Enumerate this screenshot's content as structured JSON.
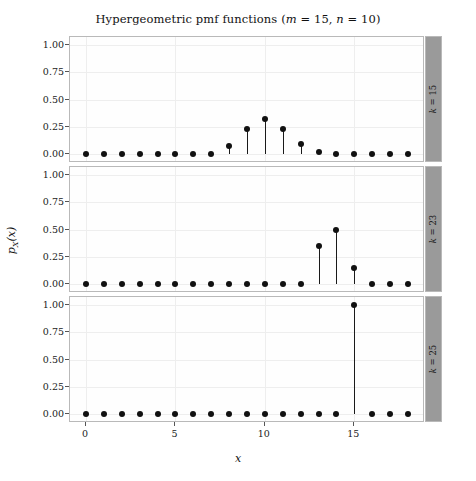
{
  "chart_data": {
    "type": "scatter",
    "title": "Hypergeometric pmf functions (m = 15, n = 10)",
    "title_parts": {
      "lead": "Hypergeometric pmf functions (",
      "m_sym": "m",
      "m_eq": " = 15, ",
      "n_sym": "n",
      "n_eq": " = 10)"
    },
    "xlabel": "x",
    "ylabel": "pX (x)",
    "ylabel_parts": {
      "p": "p",
      "sub": "X",
      "arg": "(x)"
    },
    "grid": true,
    "legend": "none",
    "xlim": [
      -0.9,
      18.9
    ],
    "ylim": [
      -0.06,
      1.06
    ],
    "xticks": [
      0,
      5,
      10,
      15
    ],
    "xticklabels": [
      "0",
      "5",
      "10",
      "15"
    ],
    "yticks": [
      0,
      0.25,
      0.5,
      0.75,
      1.0
    ],
    "yticklabels": [
      "0.00",
      "0.25",
      "0.50",
      "0.75",
      "1.00"
    ],
    "x": [
      0,
      1,
      2,
      3,
      4,
      5,
      6,
      7,
      8,
      9,
      10,
      11,
      12,
      13,
      14,
      15,
      16,
      17,
      18
    ],
    "panels": [
      {
        "strip_label": "k = 15",
        "strip_parts": {
          "k": "k",
          "eq": " = 15"
        },
        "k": 15,
        "values": [
          0,
          0,
          0,
          0,
          0,
          0,
          0,
          0.0009,
          0.0725,
          0.235,
          0.3204,
          0.235,
          0.0907,
          0.0181,
          0.0015,
          0,
          0,
          0,
          0
        ]
      },
      {
        "strip_label": "k = 23",
        "strip_parts": {
          "k": "k",
          "eq": " = 23"
        },
        "k": 23,
        "values": [
          0,
          0,
          0,
          0,
          0,
          0,
          0,
          0,
          0,
          0,
          0,
          0,
          0,
          0.3478,
          0.5,
          0.1522,
          0,
          0,
          0
        ]
      },
      {
        "strip_label": "k = 25",
        "strip_parts": {
          "k": "k",
          "eq": " = 25"
        },
        "k": 25,
        "values": [
          0,
          0,
          0,
          0,
          0,
          0,
          0,
          0,
          0,
          0,
          0,
          0,
          0,
          0,
          0,
          1.0,
          0,
          0,
          0
        ]
      }
    ]
  }
}
